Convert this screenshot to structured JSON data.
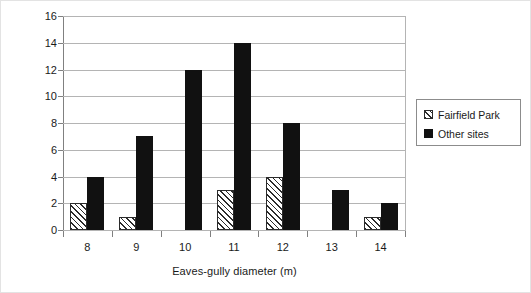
{
  "chart_data": {
    "type": "bar",
    "title": "",
    "xlabel": "Eaves-gully diameter (m)",
    "ylabel": "No. of houses",
    "categories": [
      "8",
      "9",
      "10",
      "11",
      "12",
      "13",
      "14"
    ],
    "series": [
      {
        "name": "Fairfield Park",
        "values": [
          2,
          1,
          0,
          3,
          4,
          0,
          1
        ],
        "fill": "hatched",
        "color": "#2b2b2b"
      },
      {
        "name": "Other sites",
        "values": [
          4,
          7,
          12,
          14,
          8,
          3,
          2
        ],
        "fill": "solid",
        "color": "#111111"
      }
    ],
    "ylim": [
      0,
      16
    ],
    "yticks": [
      0,
      2,
      4,
      6,
      8,
      10,
      12,
      14,
      16
    ],
    "ytick_labels": [
      "0",
      "2",
      "4",
      "6",
      "8",
      "10",
      "12",
      "14",
      "16"
    ],
    "grid": "horizontal",
    "legend_position": "right",
    "legend_entries": [
      "Fairfield Park",
      "Other sites"
    ]
  },
  "legend": {
    "items": [
      {
        "label": "Fairfield Park",
        "swatch": "hatched-square-icon"
      },
      {
        "label": "Other sites",
        "swatch": "filled-square-icon"
      }
    ]
  }
}
